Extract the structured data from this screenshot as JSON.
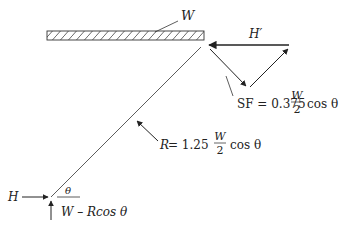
{
  "diagram": {
    "type": "free-body diagram",
    "colors": {
      "line": "#333333",
      "text": "#222222",
      "background": "#ffffff"
    },
    "beam": {
      "label": "W"
    },
    "force_triangle": {
      "horizontal_label": "H′",
      "shear_label": {
        "prefix": "SF = 0.375",
        "frac_num": "W",
        "frac_den": "2",
        "suffix": "cos θ"
      }
    },
    "strut": {
      "reaction_label": {
        "prefix_var": "R",
        "prefix": " = 1.25",
        "frac_num": "W",
        "frac_den": "2",
        "suffix": "cos θ"
      }
    },
    "support": {
      "horizontal_label": "H",
      "angle_label": "θ",
      "vertical_label": "W – Rcos θ"
    }
  }
}
